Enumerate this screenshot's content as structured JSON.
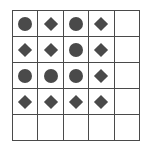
{
  "grid": {
    "rows": 5,
    "cols": 5,
    "cells": [
      [
        "circle",
        "diamond",
        "circle",
        "diamond",
        ""
      ],
      [
        "diamond",
        "diamond",
        "circle",
        "diamond",
        ""
      ],
      [
        "circle",
        "circle",
        "circle",
        "diamond",
        ""
      ],
      [
        "diamond",
        "diamond",
        "diamond",
        "diamond",
        ""
      ],
      [
        "",
        "",
        "",
        "",
        ""
      ]
    ],
    "colors": {
      "shape": "#4a4a4a",
      "line": "#4a4a4a",
      "background": "#ffffff"
    }
  }
}
